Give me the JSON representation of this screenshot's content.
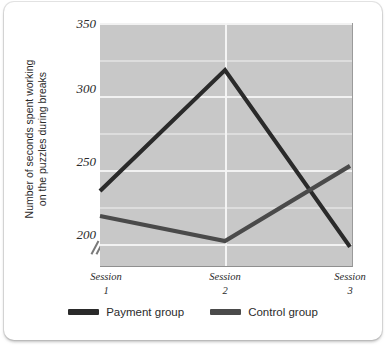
{
  "figure": {
    "background": "#ffffff",
    "plot_background": "#c8c8c8"
  },
  "chart_data": {
    "type": "line",
    "title": "",
    "xlabel": "",
    "ylabel": "Number of seconds spent working on the puzzles during breaks",
    "ylabel_line1": "Number of seconds spent working",
    "ylabel_line2": "on the puzzles during breaks",
    "categories": [
      "Session 1",
      "Session 2",
      "Session 3"
    ],
    "x_tick_lines": [
      {
        "name": "Session",
        "num": "1"
      },
      {
        "name": "Session",
        "num": "2"
      },
      {
        "name": "Session",
        "num": "3"
      }
    ],
    "ylim": [
      185,
      350
    ],
    "y_ticks": [
      200,
      250,
      300,
      350
    ],
    "y_tick_labels": [
      "200",
      "250",
      "300",
      "350"
    ],
    "y_minor_ticks": [
      225,
      275,
      325
    ],
    "grid": true,
    "grid_vertical_at": [
      "Session 2"
    ],
    "axis_break": true,
    "axis_break_symbol": "//",
    "legend_position": "bottom-center",
    "series": [
      {
        "name": "Payment group",
        "color": "#2a2a2a",
        "values": [
          236,
          318,
          198
        ]
      },
      {
        "name": "Control group",
        "color": "#4a4a4a",
        "values": [
          219,
          202,
          253
        ]
      }
    ]
  },
  "legend": {
    "items": [
      {
        "label": "Payment group",
        "color": "#2a2a2a"
      },
      {
        "label": "Control group",
        "color": "#4a4a4a"
      }
    ]
  }
}
